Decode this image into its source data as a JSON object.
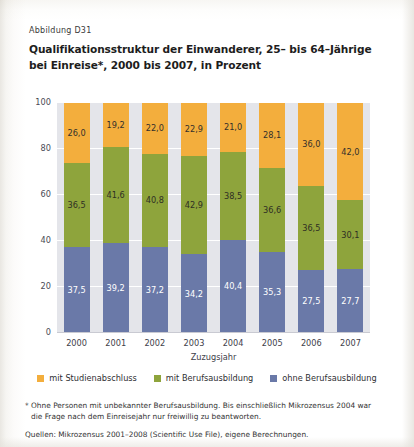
{
  "figure_label": "Abbildung D31",
  "title_line1": "Qualifikationsstruktur der Einwanderer, 25– bis 64–Jährige",
  "title_line2": "bei Einreise*, 2000 bis 2007, in Prozent",
  "colors": {
    "top": "#f3ae3d",
    "mid": "#8ea43c",
    "bottom": "#6a79a8",
    "plot_background": "#e4e5ea",
    "gridline": "#ffffff"
  },
  "legend": {
    "position": "bottom-center",
    "items": [
      {
        "label": "mit Studienabschluss",
        "color": "#f3ae3d",
        "swatch_name": "legend-swatch-studienabschluss"
      },
      {
        "label": "mit Berufsausbildung",
        "color": "#8ea43c",
        "swatch_name": "legend-swatch-berufsausbildung"
      },
      {
        "label": "ohne Berufsausbildung",
        "color": "#6a79a8",
        "swatch_name": "legend-swatch-ohne-berufsausbildung"
      }
    ]
  },
  "notes": {
    "footnote_line1": "* Ohne Personen mit unbekannter Berufsausbildung. Bis einschließlich Mikrozensus 2004 war",
    "footnote_line2": "die Frage nach dem Einreisejahr nur freiwillig zu beantworten.",
    "source": "Quellen: Mikrozensus 2001–2008 (Scientific Use File), eigene Berechnungen."
  },
  "chart_data": {
    "type": "bar",
    "subtype": "stacked-percent",
    "title": "Qualifikationsstruktur der Einwanderer, 25– bis 64–Jährige bei Einreise*, 2000 bis 2007, in Prozent",
    "xlabel": "Zuzugsjahr",
    "ylabel": "",
    "ylim": [
      0,
      100
    ],
    "yticks": [
      0,
      20,
      40,
      60,
      80,
      100
    ],
    "ytick_labels": [
      "0",
      "20",
      "40",
      "60",
      "80",
      "100"
    ],
    "grid": true,
    "categories": [
      "2000",
      "2001",
      "2002",
      "2003",
      "2004",
      "2005",
      "2006",
      "2007"
    ],
    "series": [
      {
        "name": "ohne Berufsausbildung",
        "color": "#6a79a8",
        "values": [
          37.5,
          39.2,
          37.2,
          34.2,
          40.4,
          35.3,
          27.5,
          27.7
        ],
        "labels": [
          "37,5",
          "39,2",
          "37,2",
          "34,2",
          "40,4",
          "35,3",
          "27,5",
          "27,7"
        ]
      },
      {
        "name": "mit Berufsausbildung",
        "color": "#8ea43c",
        "values": [
          36.5,
          41.6,
          40.8,
          42.9,
          38.5,
          36.6,
          36.5,
          30.1
        ],
        "labels": [
          "36,5",
          "41,6",
          "40,8",
          "42,9",
          "38,5",
          "36,6",
          "36,5",
          "30,1"
        ]
      },
      {
        "name": "mit Studienabschluss",
        "color": "#f3ae3d",
        "values": [
          26.0,
          19.2,
          22.0,
          22.9,
          21.0,
          28.1,
          36.0,
          42.0
        ],
        "labels": [
          "26,0",
          "19,2",
          "22,0",
          "22,9",
          "21,0",
          "28,1",
          "36,0",
          "42,0"
        ]
      }
    ]
  }
}
